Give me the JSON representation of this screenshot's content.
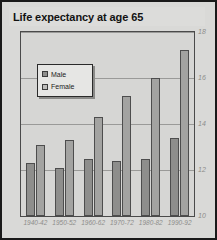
{
  "chart": {
    "title": "Life expectancy at age 65",
    "legend": {
      "position": "inside-top-left",
      "entries": [
        {
          "name": "Male",
          "icon": "legend-swatch-male",
          "color": "#8e8e8c"
        },
        {
          "name": "Female",
          "icon": "legend-swatch-female",
          "color": "#bdbdbb"
        }
      ]
    }
  },
  "chart_data": {
    "type": "bar",
    "title": "Life expectancy at age 65",
    "xlabel": "",
    "ylabel": "",
    "categories": [
      "1940-42",
      "1950-52",
      "1960-62",
      "1970-72",
      "1980-82",
      "1990-92"
    ],
    "series": [
      {
        "name": "Male",
        "color": "#8e8e8c",
        "values": [
          12.3,
          12.1,
          12.5,
          12.4,
          12.5,
          13.4
        ]
      },
      {
        "name": "Female",
        "color": "#a3a3a1",
        "values": [
          13.1,
          13.3,
          14.3,
          15.2,
          16.0,
          17.2
        ]
      }
    ],
    "ylim": [
      10,
      18
    ],
    "yticks": [
      10,
      12,
      14,
      16,
      18
    ],
    "ytick_labels": [
      "10",
      "12",
      "14",
      "16",
      "18"
    ],
    "y_axis_side": "right",
    "grid": true,
    "grid_axis": "y",
    "legend_position": "inside-top-left"
  },
  "colors": {
    "background": "#d8d8d6",
    "plot_background": "#d6d6d4",
    "frame": "#1a1a1a",
    "gridline": "#9a9a98",
    "tick_label": "#8d8d8b",
    "title_text": "#121212"
  }
}
